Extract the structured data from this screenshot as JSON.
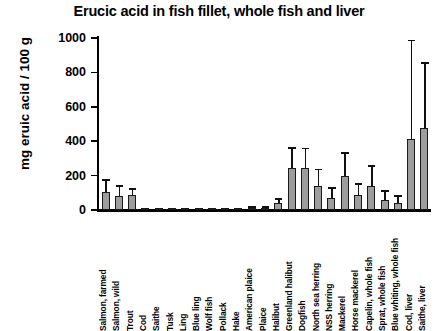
{
  "chart_data": {
    "type": "bar",
    "title": "Erucic acid in fish fillet, whole fish and liver",
    "xlabel": "",
    "ylabel": "mg eruic acid / 100 g",
    "ylim": [
      0,
      1000
    ],
    "yticks": [
      0,
      200,
      400,
      600,
      800,
      1000
    ],
    "grid": false,
    "legend": "none",
    "error_bars": "upper error bars shown (standard deviation)",
    "bar_color": "#9d9d9d",
    "bar_edge_color": "#1a1a1a",
    "categories": [
      "Salmon, farmed",
      "Salmon, wild",
      "Trout",
      "Cod",
      "Saithe",
      "Tusk",
      "Ling",
      "Blue ling",
      "Wolf fish",
      "Pollack",
      "Hake",
      "American plaice",
      "Plaice",
      "Halibut",
      "Greenland halibut",
      "Dogfish",
      "North sea herring",
      "NSS herring",
      "Mackerel",
      "Horse mackerel",
      "Capelin, whole fish",
      "Sprat, whole fish",
      "Blue whiting, whole fish",
      "Cod, liver",
      "Saithe, liver"
    ],
    "values": [
      105,
      81,
      87,
      4,
      3,
      3,
      3,
      3,
      3,
      5,
      3,
      12,
      10,
      38,
      245,
      245,
      140,
      70,
      198,
      87,
      140,
      58,
      41,
      413,
      477
    ],
    "errors_upper": [
      175,
      140,
      120,
      6,
      5,
      5,
      5,
      5,
      5,
      8,
      5,
      18,
      16,
      62,
      360,
      358,
      235,
      128,
      330,
      150,
      255,
      110,
      80,
      985,
      855
    ]
  }
}
